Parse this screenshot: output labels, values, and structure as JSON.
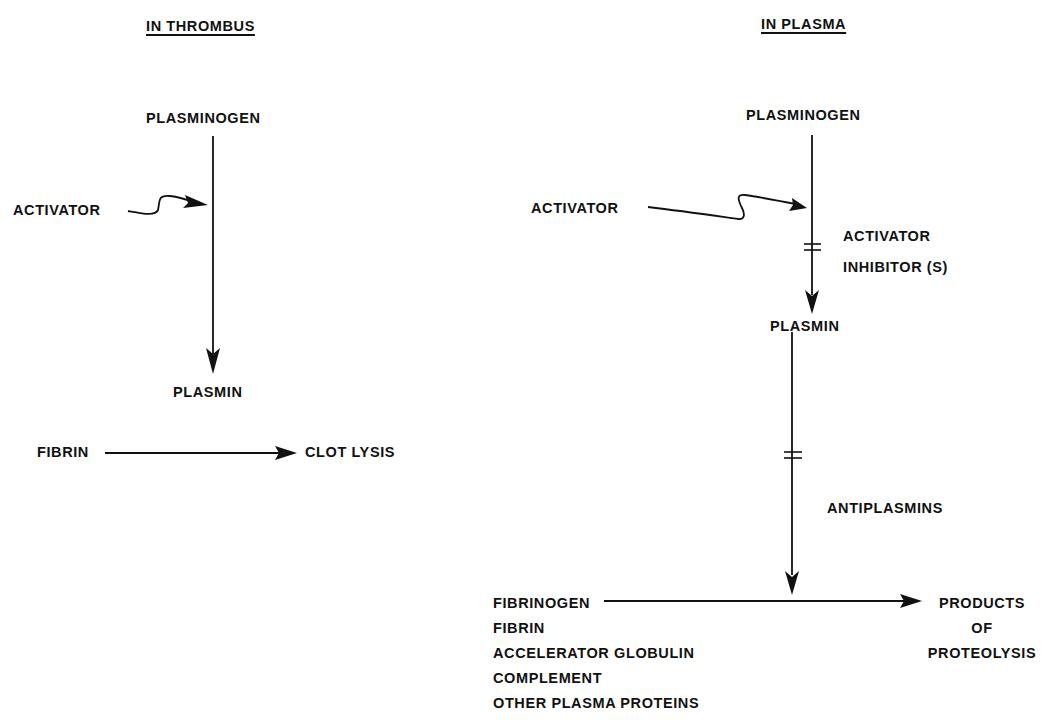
{
  "left_panel": {
    "title": "IN THROMBUS",
    "plasminogen": "PLASMINOGEN",
    "activator": "ACTIVATOR",
    "plasmin": "PLASMIN",
    "fibrin": "FIBRIN",
    "clot_lysis": "CLOT LYSIS"
  },
  "right_panel": {
    "title": "IN PLASMA",
    "plasminogen": "PLASMINOGEN",
    "activator": "ACTIVATOR",
    "activator_inhibitor_line1": "ACTIVATOR",
    "activator_inhibitor_line2": "INHIBITOR (S)",
    "plasmin": "PLASMIN",
    "antiplasmins": "ANTIPLASMINS",
    "substrates": [
      "FIBRINOGEN",
      "FIBRIN",
      "ACCELERATOR GLOBULIN",
      "COMPLEMENT",
      "OTHER PLASMA PROTEINS"
    ],
    "products_line1": "PRODUCTS",
    "products_line2": "OF",
    "products_line3": "PROTEOLYSIS"
  }
}
